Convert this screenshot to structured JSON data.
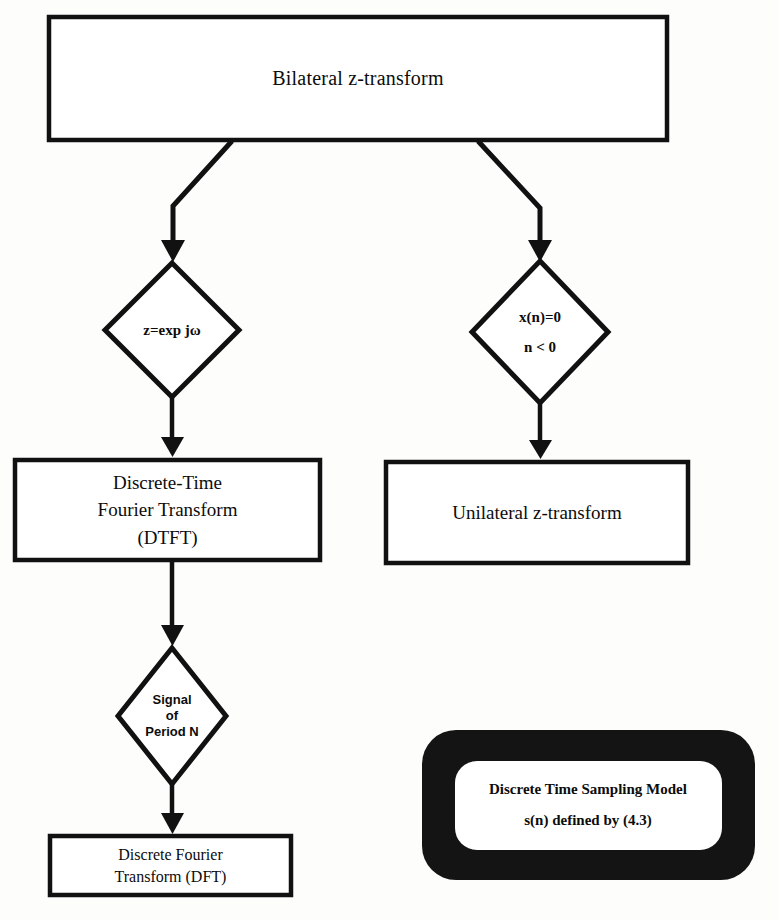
{
  "diagram": {
    "background_color": "#fdfdfc",
    "stroke_color": "#111111",
    "nodes": {
      "bilateral": {
        "shape": "rectangle",
        "lines": [
          "Bilateral z-transform"
        ]
      },
      "decision_zexp": {
        "shape": "diamond",
        "lines": [
          "z=exp jω"
        ]
      },
      "decision_xn": {
        "shape": "diamond",
        "lines": [
          "x(n)=0",
          "n < 0"
        ]
      },
      "dtft": {
        "shape": "rectangle",
        "lines": [
          "Discrete-Time",
          "Fourier Transform",
          "(DTFT)"
        ]
      },
      "unilateral": {
        "shape": "rectangle",
        "lines": [
          "Unilateral z-transform"
        ]
      },
      "decision_signal": {
        "shape": "diamond",
        "lines": [
          "Signal",
          "of",
          "Period N"
        ]
      },
      "dft": {
        "shape": "rectangle",
        "lines": [
          "Discrete Fourier",
          "Transform (DFT)"
        ]
      },
      "sampling_model": {
        "shape": "rounded-rectangle-thick",
        "lines": [
          "Discrete Time Sampling Model",
          "s(n) defined by (4.3)"
        ]
      }
    },
    "connectors": [
      {
        "name": "bilateral-to-zexp",
        "from": "bilateral",
        "to": "decision_zexp",
        "style": "elbow-arrow"
      },
      {
        "name": "bilateral-to-xn",
        "from": "bilateral",
        "to": "decision_xn",
        "style": "elbow-arrow"
      },
      {
        "name": "zexp-to-dtft",
        "from": "decision_zexp",
        "to": "dtft",
        "style": "straight-arrow"
      },
      {
        "name": "xn-to-unilateral",
        "from": "decision_xn",
        "to": "unilateral",
        "style": "straight-arrow"
      },
      {
        "name": "dtft-to-signal",
        "from": "dtft",
        "to": "decision_signal",
        "style": "straight-arrow"
      },
      {
        "name": "signal-to-dft",
        "from": "decision_signal",
        "to": "dft",
        "style": "straight-arrow"
      }
    ]
  }
}
